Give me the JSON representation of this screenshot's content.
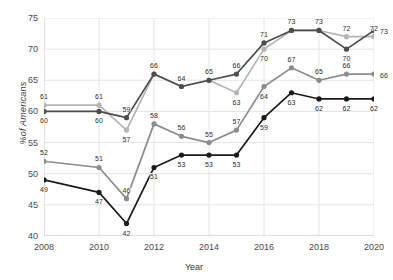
{
  "chart_data": {
    "type": "line",
    "title": "",
    "xlabel": "Year",
    "ylabel": "%of Americans",
    "x": [
      2008,
      2010,
      2011,
      2012,
      2013,
      2014,
      2015,
      2016,
      2017,
      2018,
      2019,
      2020
    ],
    "xlim": [
      2008,
      2020
    ],
    "ylim": [
      40,
      75
    ],
    "xticks": [
      "2008",
      "2010",
      "2012",
      "2014",
      "2016",
      "2018",
      "2020"
    ],
    "yticks": [
      "40",
      "45",
      "50",
      "55",
      "60",
      "65",
      "70",
      "75"
    ],
    "grid": true,
    "legend": "none",
    "series": [
      {
        "name": "series-light-gray",
        "color": "#b5b5b5",
        "values": [
          61,
          61,
          57,
          66,
          64,
          65,
          63,
          70,
          73,
          73,
          72,
          72
        ],
        "labels": [
          "61",
          "61",
          "57",
          "66",
          "64",
          "65",
          "63",
          "70",
          "73",
          "73",
          "72",
          "72"
        ],
        "label_pos": [
          "above",
          "above",
          "below",
          "above",
          "above",
          "above",
          "below",
          "below",
          "above",
          "above",
          "above",
          "above"
        ]
      },
      {
        "name": "series-dark-gray",
        "color": "#4d4d4d",
        "values": [
          60,
          60,
          59,
          66,
          64,
          65,
          66,
          71,
          73,
          73,
          70,
          73
        ],
        "labels": [
          "60",
          "60",
          "59",
          "66",
          "",
          "",
          "66",
          "71",
          "",
          "",
          "70",
          "73"
        ],
        "label_pos": [
          "below",
          "below",
          "above",
          "above",
          "",
          "",
          "above",
          "above",
          "",
          "",
          "below",
          "right"
        ]
      },
      {
        "name": "series-medium-gray",
        "color": "#8c8c8c",
        "values": [
          52,
          51,
          46,
          58,
          56,
          55,
          57,
          64,
          67,
          65,
          66,
          66
        ],
        "labels": [
          "52",
          "51",
          "46",
          "58",
          "56",
          "55",
          "57",
          "64",
          "67",
          "65",
          "66",
          "66"
        ],
        "label_pos": [
          "above",
          "above",
          "above",
          "above",
          "above",
          "above",
          "above",
          "below",
          "above",
          "above",
          "above",
          "right"
        ]
      },
      {
        "name": "series-black",
        "color": "#1a1a1a",
        "values": [
          49,
          47,
          42,
          51,
          53,
          53,
          53,
          59,
          63,
          62,
          62,
          62
        ],
        "labels": [
          "49",
          "47",
          "42",
          "51",
          "53",
          "53",
          "53",
          "59",
          "63",
          "62",
          "62",
          "62"
        ],
        "label_pos": [
          "below",
          "below",
          "below",
          "below",
          "below",
          "below",
          "below",
          "below",
          "below",
          "below",
          "below",
          "below"
        ]
      }
    ]
  }
}
